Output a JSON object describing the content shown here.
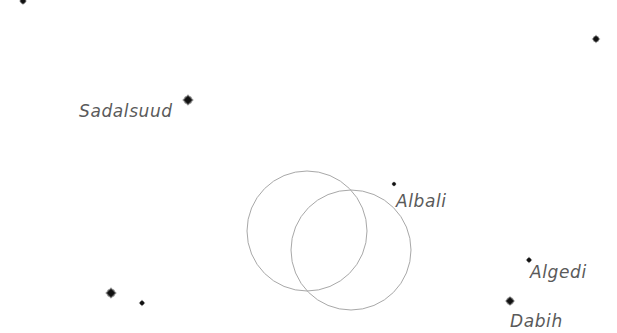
{
  "chart": {
    "type": "star-chart",
    "background": "#ffffff",
    "star_color": "#111111",
    "label_color": "#5a5a5a",
    "circle_color": "#a8a8a8"
  },
  "stars": [
    {
      "name": "Sadalsuud",
      "x": 188,
      "y": 100,
      "r": 3.2,
      "label": "Sadalsuud",
      "label_x": 79,
      "label_y": 117,
      "label_anchor": "start"
    },
    {
      "name": "Albali",
      "x": 394,
      "y": 184,
      "r": 1.5,
      "label": "Albali",
      "label_x": 396,
      "label_y": 207,
      "label_anchor": "start"
    },
    {
      "name": "Algedi",
      "x": 529,
      "y": 260,
      "r": 1.8,
      "label": "Algedi",
      "label_x": 530,
      "label_y": 278,
      "label_anchor": "start"
    },
    {
      "name": "Dabih",
      "x": 510,
      "y": 301,
      "r": 2.8,
      "label": "Dabih",
      "label_x": 510,
      "label_y": 327,
      "label_anchor": "start"
    },
    {
      "name": "unlabeled-top-left",
      "x": 23,
      "y": 1,
      "r": 2.2,
      "label": null
    },
    {
      "name": "unlabeled-top-right",
      "x": 596,
      "y": 39,
      "r": 2.4,
      "label": null
    },
    {
      "name": "unlabeled-bottom-left-bright",
      "x": 111,
      "y": 293,
      "r": 3.2,
      "label": null
    },
    {
      "name": "unlabeled-bottom-left-faint",
      "x": 142,
      "y": 303,
      "r": 1.8,
      "label": null
    }
  ],
  "circles": [
    {
      "name": "field-of-view-1",
      "cx": 307,
      "cy": 231,
      "r": 60
    },
    {
      "name": "field-of-view-2",
      "cx": 351,
      "cy": 250,
      "r": 60
    }
  ],
  "labels": {
    "sadalsuud": "Sadalsuud",
    "albali": "Albali",
    "algedi": "Algedi",
    "dabih": "Dabih"
  }
}
